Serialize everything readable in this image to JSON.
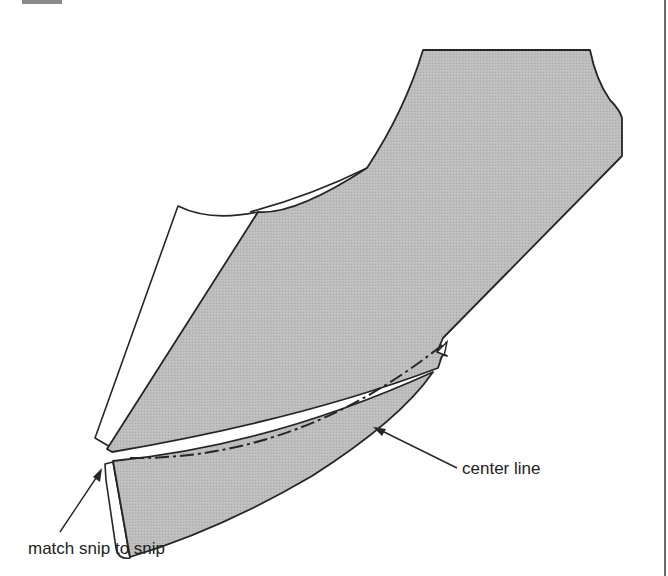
{
  "diagram": {
    "type": "sewing-pattern",
    "labels": {
      "center_line": "center line",
      "match_snip": "match snip to snip"
    },
    "colors": {
      "fabric_fill": "#b9b9b9",
      "outline": "#262626",
      "paper_fill": "#ffffff",
      "text": "#222222"
    }
  }
}
